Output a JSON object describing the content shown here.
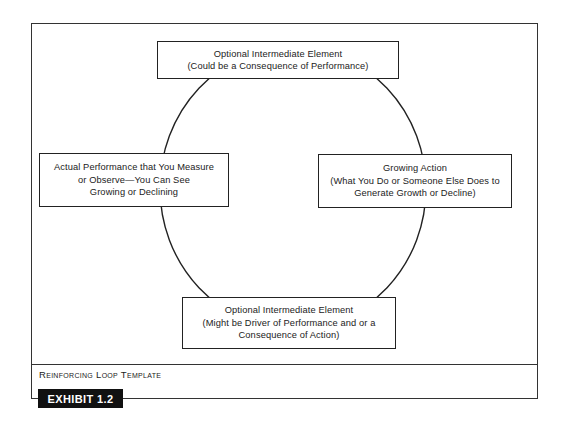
{
  "diagram": {
    "type": "reinforcing-loop",
    "nodes": {
      "top": {
        "lines": [
          "Optional Intermediate Element",
          "(Could be a Consequence of Performance)"
        ]
      },
      "left": {
        "lines": [
          "Actual Performance that You Measure",
          "or Observe—You Can See",
          "Growing or Declining"
        ]
      },
      "right": {
        "lines": [
          "Growing Action",
          "(What You Do or Someone Else Does to",
          "Generate Growth or Decline)"
        ]
      },
      "bottom": {
        "lines": [
          "Optional Intermediate Element",
          "(Might be Driver of Performance and or a",
          "Consequence of Action)"
        ]
      }
    },
    "loop_shape": "ellipse",
    "colors": {
      "line": "#222222",
      "exhibit_bg": "#111111",
      "exhibit_text": "#ffffff"
    }
  },
  "caption": "Reinforcing Loop Template",
  "exhibit_label": "EXHIBIT 1.2"
}
